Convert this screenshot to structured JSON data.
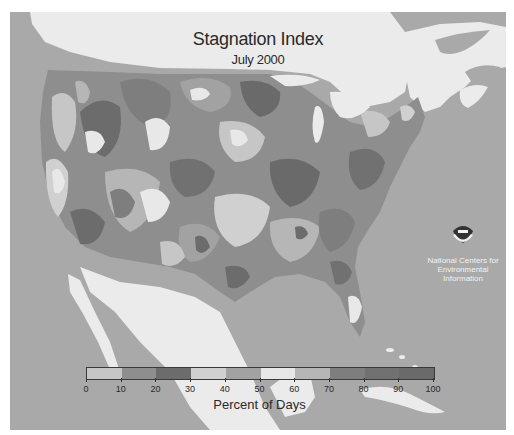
{
  "title": "Stagnation Index",
  "subtitle": "July 2000",
  "logo": {
    "icon": "noaa-logo-icon",
    "badge_text": "NOAA",
    "org_lines": [
      "National Centers for",
      "Environmental",
      "Information"
    ]
  },
  "legend": {
    "label": "Percent of Days",
    "ticks": [
      "0",
      "10",
      "20",
      "30",
      "40",
      "50",
      "60",
      "70",
      "80",
      "90",
      "100"
    ],
    "bins": [
      {
        "range": "0-10",
        "color": "#c6c6c6"
      },
      {
        "range": "10-20",
        "color": "#8e8e8e"
      },
      {
        "range": "20-30",
        "color": "#6c6c6c"
      },
      {
        "range": "30-40",
        "color": "#d0d0d0"
      },
      {
        "range": "40-50",
        "color": "#a2a2a2"
      },
      {
        "range": "50-60",
        "color": "#e8e8e8"
      },
      {
        "range": "60-70",
        "color": "#b6b6b6"
      },
      {
        "range": "70-80",
        "color": "#7e7e7e"
      },
      {
        "range": "80-90",
        "color": "#717171"
      },
      {
        "range": "90-100",
        "color": "#6a6a6a"
      }
    ]
  },
  "colors": {
    "ocean": "#a9a9a9",
    "foreign_land": "#ebebeb",
    "text": "#2a2a2a"
  }
}
